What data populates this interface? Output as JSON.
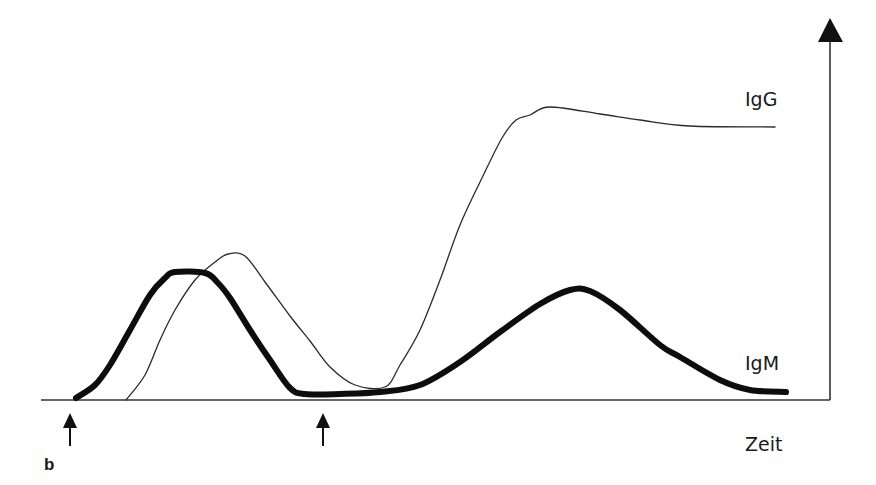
{
  "figure": {
    "panel_label": "b",
    "x_axis_label": "Zeit",
    "y_axis_label": "",
    "series_labels": {
      "igg": "IgG",
      "igm": "IgM"
    },
    "markers": [
      {
        "name": "first-exposure-arrow",
        "x": 70
      },
      {
        "name": "second-exposure-arrow",
        "x": 323
      }
    ],
    "colors": {
      "line": "#1a1a1a",
      "axis": "#333333",
      "background": "#ffffff"
    }
  },
  "chart_data": {
    "type": "line",
    "title": "",
    "xlabel": "Zeit",
    "ylabel": "",
    "grid": false,
    "legend": "inline labels at right end of curves",
    "x_ticks": [],
    "y_ticks": [],
    "annotations": [
      "arrow at first antigen exposure",
      "arrow at second antigen exposure",
      "b"
    ],
    "series": [
      {
        "name": "IgM",
        "style": "thick",
        "points": [
          [
            76,
            398
          ],
          [
            95,
            385
          ],
          [
            110,
            365
          ],
          [
            130,
            330
          ],
          [
            150,
            295
          ],
          [
            165,
            278
          ],
          [
            175,
            272
          ],
          [
            205,
            273
          ],
          [
            218,
            283
          ],
          [
            230,
            298
          ],
          [
            250,
            330
          ],
          [
            270,
            360
          ],
          [
            290,
            388
          ],
          [
            305,
            394
          ],
          [
            340,
            394
          ],
          [
            380,
            392
          ],
          [
            420,
            385
          ],
          [
            460,
            362
          ],
          [
            500,
            332
          ],
          [
            540,
            304
          ],
          [
            570,
            290
          ],
          [
            590,
            291
          ],
          [
            620,
            310
          ],
          [
            660,
            345
          ],
          [
            680,
            357
          ],
          [
            720,
            380
          ],
          [
            750,
            390
          ],
          [
            786,
            392
          ]
        ]
      },
      {
        "name": "IgG",
        "style": "thin",
        "points": [
          [
            126,
            400
          ],
          [
            145,
            375
          ],
          [
            160,
            340
          ],
          [
            175,
            310
          ],
          [
            195,
            280
          ],
          [
            215,
            262
          ],
          [
            228,
            254
          ],
          [
            245,
            256
          ],
          [
            265,
            282
          ],
          [
            290,
            316
          ],
          [
            310,
            341
          ],
          [
            330,
            367
          ],
          [
            355,
            385
          ],
          [
            385,
            387
          ],
          [
            400,
            365
          ],
          [
            420,
            330
          ],
          [
            440,
            280
          ],
          [
            460,
            225
          ],
          [
            482,
            178
          ],
          [
            502,
            138
          ],
          [
            516,
            120
          ],
          [
            530,
            115
          ],
          [
            550,
            107
          ],
          [
            600,
            114
          ],
          [
            640,
            120
          ],
          [
            690,
            126
          ],
          [
            775,
            127
          ]
        ]
      }
    ]
  }
}
